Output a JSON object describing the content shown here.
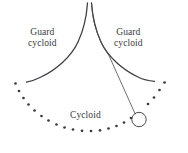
{
  "figure": {
    "name": "cycloidal-pendulum",
    "background_color": "#ffffff",
    "stroke_color": "#3f3f46",
    "dot_color": "#3a3a42",
    "text_color": "#3a3a40",
    "width": 188,
    "height": 153,
    "labels": {
      "guard_left": {
        "line1": "Guard",
        "line2": "cycloid"
      },
      "guard_right": {
        "line1": "Guard",
        "line2": "cycloid"
      },
      "path": {
        "line1": "Cycloid"
      }
    },
    "elements": {
      "guard_cycloid_left_name": "guard-cycloid-left-curve",
      "guard_cycloid_right_name": "guard-cycloid-right-curve",
      "pendulum_string_name": "pendulum-string",
      "pendulum_bob_name": "pendulum-bob",
      "cycloid_path_name": "cycloid-dotted-path",
      "cusp_name": "cusp-point"
    },
    "geometry": {
      "cusp": {
        "x": 89.5,
        "y": 3
      },
      "guard_left_path": "M 87.5 3 C 86.6 16 84.5 28 78 42 C 71 57 56 70 41 77 C 35 80 30 81.5 26.5 82.2",
      "guard_right_path": "M 91.5 3 C 92.4 16 94.6 28 101 42 C 108 57 123 70 138 77 C 144 80 150 81 154.5 81.3",
      "string_path": "M 91.5 3 C 92.4 16 94.6 28 101 42 C 104 48.5 107 52.5 108.8 55.2 L 135.2 114",
      "bob": {
        "cx": 139,
        "cy": 119.5,
        "r": 7.2
      },
      "stroke_width": 1.3,
      "string_width": 0.8,
      "dot_radius": 1.35,
      "dots": [
        {
          "x": 15.5,
          "y": 83.5
        },
        {
          "x": 19.0,
          "y": 91.0
        },
        {
          "x": 23.5,
          "y": 98.0
        },
        {
          "x": 28.5,
          "y": 104.5
        },
        {
          "x": 34.5,
          "y": 110.5
        },
        {
          "x": 41.5,
          "y": 116.0
        },
        {
          "x": 48.5,
          "y": 120.5
        },
        {
          "x": 56.5,
          "y": 124.5
        },
        {
          "x": 64.5,
          "y": 127.5
        },
        {
          "x": 73.0,
          "y": 129.5
        },
        {
          "x": 82.0,
          "y": 130.8
        },
        {
          "x": 91.0,
          "y": 131.0
        },
        {
          "x": 100.0,
          "y": 130.3
        },
        {
          "x": 108.5,
          "y": 128.5
        },
        {
          "x": 116.5,
          "y": 126.0
        },
        {
          "x": 124.0,
          "y": 122.5
        },
        {
          "x": 131.0,
          "y": 118.0
        },
        {
          "x": 148.0,
          "y": 104.0
        },
        {
          "x": 154.0,
          "y": 97.5
        },
        {
          "x": 159.5,
          "y": 90.0
        },
        {
          "x": 164.5,
          "y": 82.5
        }
      ]
    }
  }
}
